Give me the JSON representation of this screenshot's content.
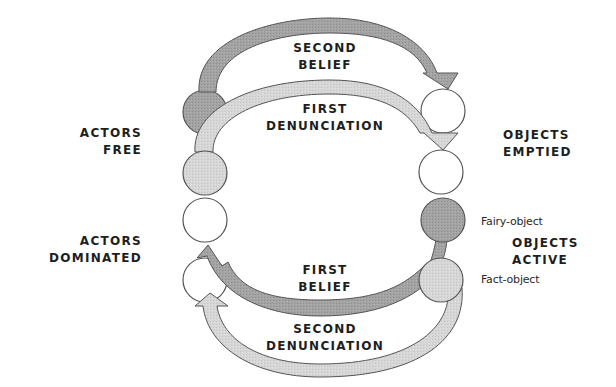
{
  "diagram": {
    "arrows": {
      "second_belief": {
        "line1": "SECOND",
        "line2": "BELIEF"
      },
      "first_denunciation": {
        "line1": "FIRST",
        "line2": "DENUNCIATION"
      },
      "first_belief": {
        "line1": "FIRST",
        "line2": "BELIEF"
      },
      "second_denunciation": {
        "line1": "SECOND",
        "line2": "DENUNCIATION"
      }
    },
    "states": {
      "actors_free": {
        "line1": "ACTORS",
        "line2": "FREE"
      },
      "actors_dominated": {
        "line1": "ACTORS",
        "line2": "DOMINATED"
      },
      "objects_emptied": {
        "line1": "OBJECTS",
        "line2": "EMPTIED"
      },
      "objects_active": {
        "line1": "OBJECTS",
        "line2": "ACTIVE"
      }
    },
    "object_labels": {
      "fairy": "Fairy-object",
      "fact": "Fact-object"
    },
    "colors": {
      "dark_fill": "#9a9a9a",
      "light_fill": "#d2d2d2",
      "white_fill": "#ffffff",
      "dark_arrow": "#a6a6a6",
      "light_arrow": "#d6d6d6",
      "stroke": "#4a4a4a"
    }
  }
}
